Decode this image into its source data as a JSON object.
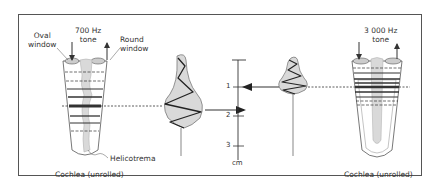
{
  "figure": {
    "left_cochlea": {
      "oval_window_label_line1": "Oval",
      "oval_window_label_line2": "window",
      "tone_label_line1": "700 Hz",
      "tone_label_line2": "tone",
      "round_window_label_line1": "Round",
      "round_window_label_line2": "window",
      "helicotrema_label": "Helicotrema",
      "caption": "Cochlea (unrolled)"
    },
    "right_cochlea": {
      "tone_label_line1": "3 000 Hz",
      "tone_label_line2": "tone",
      "caption": "Cochlea (unrolled)"
    },
    "scale": {
      "ticks": [
        "1",
        "2",
        "3"
      ],
      "unit": "cm"
    },
    "colors": {
      "line": "#333333",
      "fill_gray": "#d9d9d9",
      "frame": "#555555"
    }
  }
}
